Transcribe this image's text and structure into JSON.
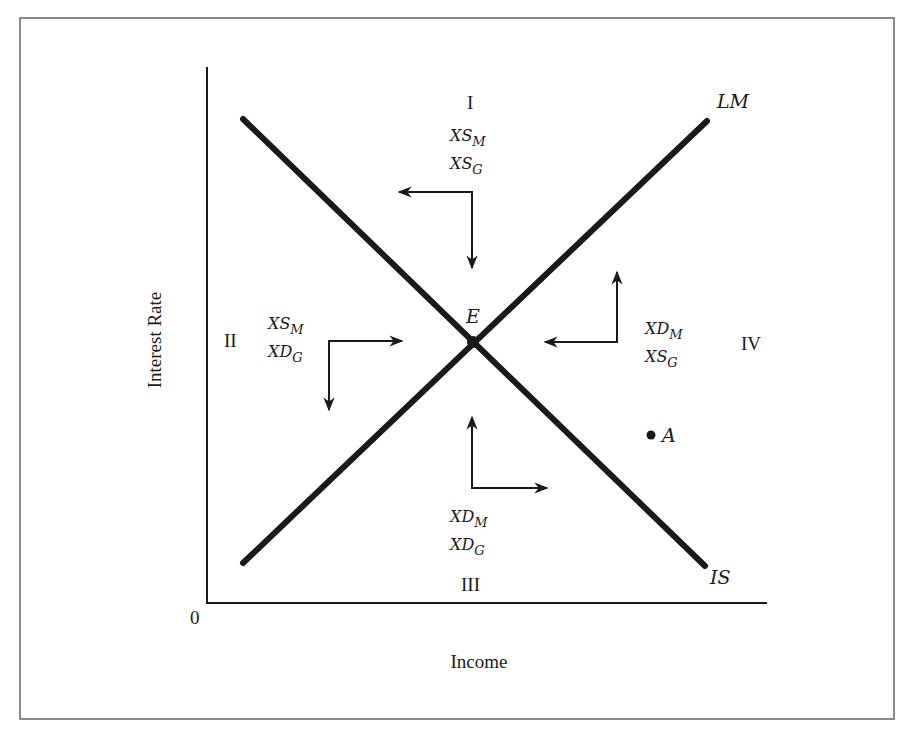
{
  "diagram": {
    "type": "IS-LM disequilibrium diagram",
    "axes": {
      "x_label": "Income",
      "y_label": "Interest Rate",
      "origin_label": "0"
    },
    "curves": {
      "is": {
        "label": "IS"
      },
      "lm": {
        "label": "LM"
      }
    },
    "equilibrium": {
      "label": "E"
    },
    "point_a": {
      "label": "A"
    },
    "regions": [
      {
        "numeral": "I",
        "lines": [
          {
            "base": "XS",
            "sub": "M"
          },
          {
            "base": "XS",
            "sub": "G"
          }
        ],
        "arrows": [
          "left",
          "down"
        ]
      },
      {
        "numeral": "II",
        "lines": [
          {
            "base": "XS",
            "sub": "M"
          },
          {
            "base": "XD",
            "sub": "G"
          }
        ],
        "arrows": [
          "right",
          "down"
        ]
      },
      {
        "numeral": "III",
        "lines": [
          {
            "base": "XD",
            "sub": "M"
          },
          {
            "base": "XD",
            "sub": "G"
          }
        ],
        "arrows": [
          "up",
          "right"
        ]
      },
      {
        "numeral": "IV",
        "lines": [
          {
            "base": "XD",
            "sub": "M"
          },
          {
            "base": "XS",
            "sub": "G"
          }
        ],
        "arrows": [
          "left",
          "up"
        ]
      }
    ],
    "colors": {
      "curve": "#1a1a1a",
      "axis": "#1a1a1a",
      "frame": "#8a8a8a",
      "background": "#ffffff"
    }
  }
}
